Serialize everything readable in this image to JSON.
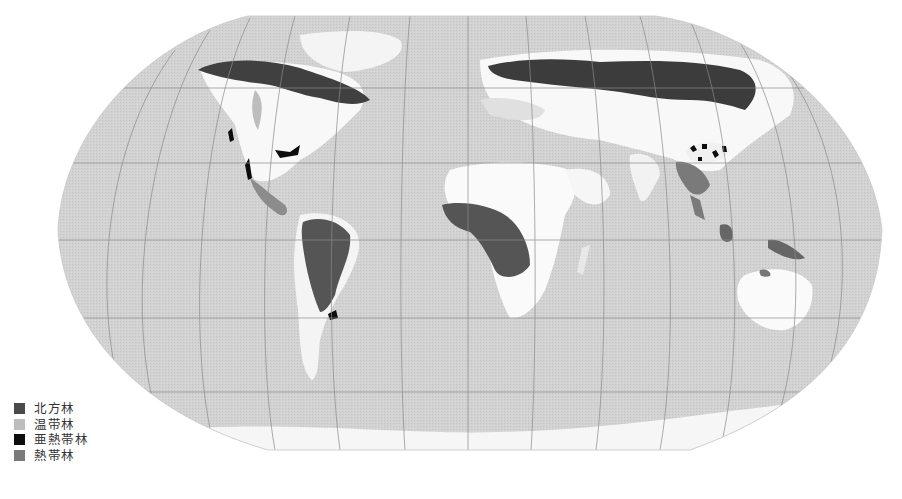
{
  "figure": {
    "type": "world-forest-distribution-map",
    "projection": "Robinson (pseudo-cylindrical)",
    "colors": {
      "ocean": "#d4d4d4",
      "land_nonforest": "#fafafa",
      "graticule": "#8a8a8a",
      "background": "#ffffff"
    }
  },
  "legend": {
    "items": [
      {
        "label": "北方林",
        "color": "#4a4a4a",
        "key": "boreal"
      },
      {
        "label": "温带林",
        "color": "#bdbdbd",
        "key": "temperate"
      },
      {
        "label": "亜熱帯林",
        "color": "#0d0d0d",
        "key": "subtropical"
      },
      {
        "label": "熱帯林",
        "color": "#7a7a7a",
        "key": "tropical"
      }
    ]
  }
}
